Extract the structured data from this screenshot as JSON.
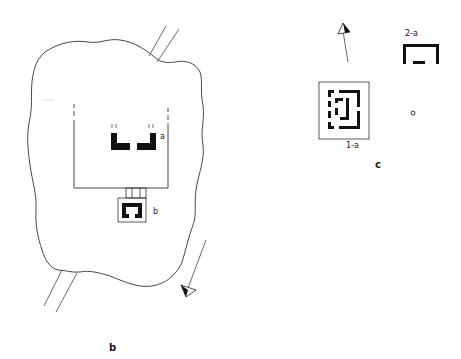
{
  "figure": {
    "type": "archaeological site plan",
    "colors": {
      "ink": "#1a1a1a",
      "line": "#333333",
      "background": "#ffffff"
    }
  },
  "panel_b": {
    "caption": "b",
    "labels": {
      "structure_a": "a",
      "structure_b": "b"
    },
    "features": [
      "irregular mound outline",
      "road track (north-east)",
      "road track (south-west)",
      "enclosure wall",
      "structure a (two L-shaped walls)",
      "structure b (gateway chamber)",
      "north arrow (pointing south-west)"
    ]
  },
  "panel_c": {
    "caption": "c",
    "labels": {
      "structure_1a": "1-a",
      "structure_2a": "2-a",
      "marker": "o"
    },
    "features": [
      "north arrow",
      "structure 1-a (framed concentric walls)",
      "structure 2-a (open rectangular wall)",
      "small circle marker"
    ]
  }
}
